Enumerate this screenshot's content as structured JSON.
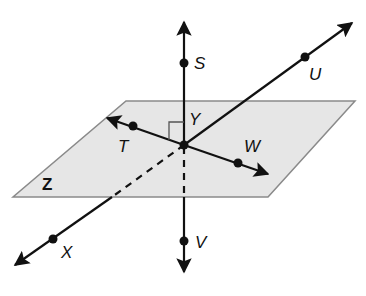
{
  "diagram": {
    "title": "",
    "plane": {
      "label": "Z",
      "fill": "#e6e6e6",
      "stroke": "#8a8a8a"
    },
    "points": {
      "S": "S",
      "U": "U",
      "T": "T",
      "Y": "Y",
      "W": "W",
      "X": "X",
      "V": "V"
    },
    "lines": [
      {
        "name": "line SV",
        "through": [
          "S",
          "Y",
          "V"
        ]
      },
      {
        "name": "line UX",
        "through": [
          "U",
          "Y",
          "X"
        ]
      },
      {
        "name": "line TW",
        "through": [
          "T",
          "Y",
          "W"
        ]
      }
    ],
    "annotations": [
      "right angle at Y between line TW and line SV"
    ],
    "colors": {
      "line": "#111111",
      "plane": "#e6e6e6"
    }
  }
}
